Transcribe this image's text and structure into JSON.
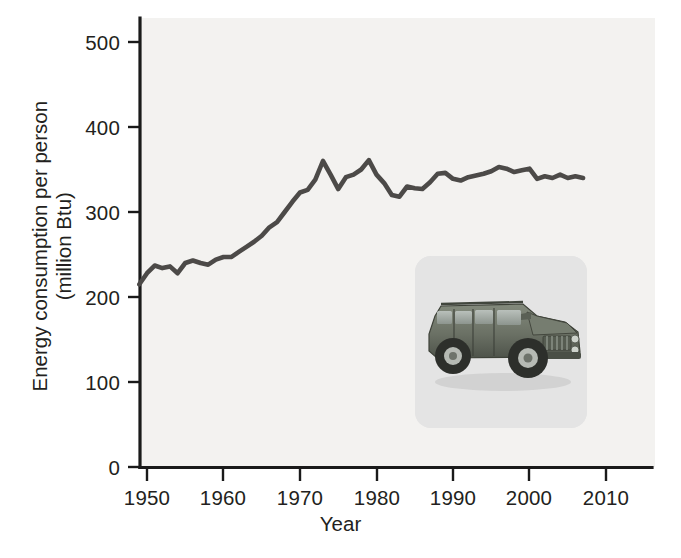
{
  "figure": {
    "background_color": "#ffffff",
    "plot_background_color": "#f3f2f0",
    "line_color": "#4c4a48",
    "axis_color": "#1a1a1a"
  },
  "axes": {
    "x_title": "Year",
    "y_title_line1": "Energy consumption per person",
    "y_title_line2": "(million Btu)",
    "x_ticks": [
      "1950",
      "1960",
      "1970",
      "1980",
      "1990",
      "2000",
      "2010"
    ],
    "y_ticks": [
      "0",
      "100",
      "200",
      "300",
      "400",
      "500"
    ]
  },
  "inset": {
    "name": "hummer-suv-photo",
    "description": "Photograph of a Hummer H1 sport utility vehicle",
    "background_color": "#e4e4e4",
    "body_color": "#6e7468"
  },
  "chart_data": {
    "type": "line",
    "title": "",
    "xlabel": "Year",
    "ylabel": "Energy consumption per person (million Btu)",
    "xlim": [
      1947,
      2011
    ],
    "ylim": [
      0,
      520
    ],
    "xticks": [
      1950,
      1960,
      1970,
      1980,
      1990,
      2000,
      2010
    ],
    "yticks": [
      0,
      100,
      200,
      300,
      400,
      500
    ],
    "grid": false,
    "legend": null,
    "series": [
      {
        "name": "Energy consumption per person (million Btu)",
        "color": "#4c4a48",
        "x": [
          1949,
          1950,
          1951,
          1952,
          1953,
          1954,
          1955,
          1956,
          1957,
          1958,
          1959,
          1960,
          1961,
          1962,
          1963,
          1964,
          1965,
          1966,
          1967,
          1968,
          1969,
          1970,
          1971,
          1972,
          1973,
          1974,
          1975,
          1976,
          1977,
          1978,
          1979,
          1980,
          1981,
          1982,
          1983,
          1984,
          1985,
          1986,
          1987,
          1988,
          1989,
          1990,
          1991,
          1992,
          1993,
          1994,
          1995,
          1996,
          1997,
          1998,
          1999,
          2000,
          2001,
          2002,
          2003,
          2004,
          2005,
          2006,
          2007
        ],
        "y": [
          215,
          228,
          237,
          234,
          236,
          228,
          240,
          243,
          240,
          238,
          244,
          247,
          247,
          253,
          259,
          265,
          272,
          282,
          288,
          300,
          312,
          323,
          326,
          338,
          360,
          344,
          327,
          341,
          344,
          350,
          361,
          344,
          334,
          320,
          318,
          330,
          328,
          327,
          335,
          345,
          346,
          339,
          337,
          341,
          343,
          345,
          348,
          353,
          351,
          347,
          349,
          351,
          339,
          342,
          340,
          344,
          340,
          342,
          340
        ]
      }
    ]
  }
}
